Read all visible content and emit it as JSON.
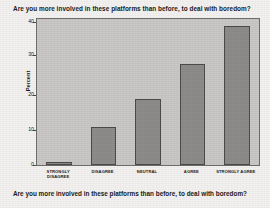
{
  "chart_data": {
    "type": "bar",
    "title": "Are you more involved in these platforms than before, to deal with boredom?",
    "xlabel": "Are you more involved in these platforms than before, to deal with boredom?",
    "ylabel": "Percent",
    "categories": [
      "STRONGLY DISAGREE",
      "DISAGREE",
      "NEUTRAL",
      "AGREE",
      "STRONGLY AGREE"
    ],
    "category_lines": [
      [
        "STRONGLY",
        "DISAGREE"
      ],
      [
        "DISAGREE"
      ],
      [
        "NEUTRAL"
      ],
      [
        "AGREE"
      ],
      [
        "STRONGLY AGREE"
      ]
    ],
    "values": [
      1,
      11,
      19,
      29,
      40
    ],
    "ylim": [
      0,
      42
    ],
    "yticks": [
      0,
      10,
      20,
      30,
      40
    ],
    "ytick_labels": [
      "0",
      "10",
      "20",
      "30",
      "40"
    ],
    "grid": false,
    "legend": "none",
    "colors": {
      "bar_fill": "#8d8c8a",
      "bar_border": "#4c4b4a",
      "plot_background": "#c9c8c6",
      "figure_background": "#f3f2f0",
      "text": "#1b1b1b",
      "axis": "#6f6e6c"
    }
  }
}
